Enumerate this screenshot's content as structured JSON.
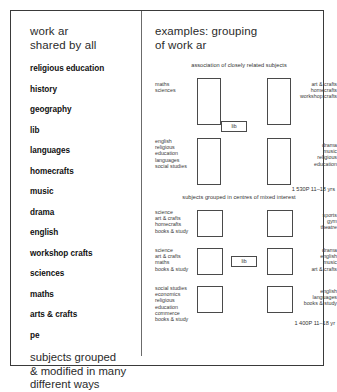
{
  "left_panel": {
    "heading": "work ar\nshared by all",
    "subjects": [
      "religious education",
      "history",
      "geography",
      "lib",
      "languages",
      "homecrafts",
      "music",
      "drama",
      "english",
      "workshop crafts",
      "sciences",
      "maths",
      "arts & crafts",
      "pe"
    ],
    "footnote": "subjects grouped\n& modified in many\ndifferent ways"
  },
  "right_panel": {
    "heading": "examples: grouping\nof work ar",
    "diagrams": [
      {
        "caption": "association of closely related subjects",
        "center_label": "lib",
        "box_shape": "tall",
        "groups_left": [
          "maths\nsciences",
          "english\nreligious\neducation\nlanguages\nsocial studies"
        ],
        "groups_right": [
          "art & crafts\nhomecrafts\nworkshop crafts",
          "drama\nmusic\nreligious\neducation"
        ],
        "stat": "1 530P 11–18 yrs"
      },
      {
        "caption": "subjects grouped in centres of mixed interest",
        "center_label": "lib",
        "box_shape": "square",
        "groups_left": [
          "science\nart & crafts\nhomecrafts\nbooks & study",
          "science\nart & crafts\nmaths\nbooks & study",
          "social studies\neconomics\nreligious\neducation\ncommerce\nbooks & study"
        ],
        "groups_right": [
          "sports\ngym\ntheatre",
          "drama\nenglish\nmusic\nart & crafts",
          "english\nlanguages\nbooks & study"
        ],
        "stat": "1 400P 11–18 yr"
      }
    ]
  },
  "colors": {
    "border": "#3a3a3a",
    "box_stroke": "#4a4a4a",
    "text": "#1a1a1a",
    "muted_text": "#3a3a3a",
    "background": "#ffffff"
  }
}
